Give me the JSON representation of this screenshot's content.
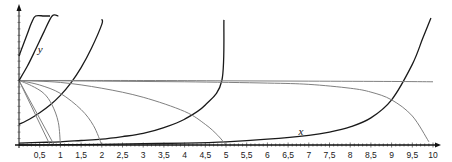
{
  "chart_data": {
    "type": "line",
    "title": "",
    "xlabel": "x",
    "ylabel": "y",
    "xlim": [
      0,
      10
    ],
    "ylim": [
      0,
      2
    ],
    "grid": false,
    "x_ticks": [
      "0,5",
      "1",
      "1,5",
      "2",
      "2,5",
      "3",
      "3,5",
      "4",
      "4,5",
      "5",
      "5,5",
      "6",
      "6,5",
      "7",
      "7,5",
      "8",
      "8,5",
      "9",
      "9,5",
      "10"
    ],
    "x_tick_values": [
      0.5,
      1,
      1.5,
      2,
      2.5,
      3,
      3.5,
      4,
      4.5,
      5,
      5.5,
      6,
      6.5,
      7,
      7.5,
      8,
      8.5,
      9,
      9.5,
      10
    ],
    "annotations": [
      {
        "text": "y",
        "x": 0.45,
        "y": 1.43
      },
      {
        "text": "x",
        "x": 6.75,
        "y": 0.16
      }
    ],
    "series": [
      {
        "name": "dark-1",
        "color": "#1a1a1a",
        "points": [
          [
            0,
            1.38
          ],
          [
            0.1,
            1.55
          ],
          [
            0.2,
            1.72
          ],
          [
            0.3,
            1.89
          ],
          [
            0.4,
            2.0
          ],
          [
            0.6,
            2.0
          ],
          [
            0.75,
            2.0
          ]
        ]
      },
      {
        "name": "dark-2",
        "color": "#1a1a1a",
        "points": [
          [
            0,
            1.0
          ],
          [
            0.2,
            1.22
          ],
          [
            0.4,
            1.48
          ],
          [
            0.6,
            1.75
          ],
          [
            0.8,
            2.0
          ],
          [
            0.95,
            2.0
          ]
        ]
      },
      {
        "name": "dark-3",
        "color": "#1a1a1a",
        "points": [
          [
            0,
            0.32
          ],
          [
            0.25,
            0.4
          ],
          [
            0.5,
            0.5
          ],
          [
            0.75,
            0.62
          ],
          [
            1.0,
            0.77
          ],
          [
            1.25,
            0.96
          ],
          [
            1.5,
            1.2
          ],
          [
            1.75,
            1.5
          ],
          [
            2.0,
            1.87
          ],
          [
            2.0,
            1.95
          ]
        ]
      },
      {
        "name": "dark-4",
        "color": "#1a1a1a",
        "points": [
          [
            0,
            0.03
          ],
          [
            0.5,
            0.04
          ],
          [
            1,
            0.05
          ],
          [
            1.5,
            0.07
          ],
          [
            2,
            0.09
          ],
          [
            2.5,
            0.13
          ],
          [
            3,
            0.18
          ],
          [
            3.5,
            0.27
          ],
          [
            4,
            0.4
          ],
          [
            4.5,
            0.62
          ],
          [
            4.9,
            1.0
          ],
          [
            4.95,
            1.94
          ]
        ]
      },
      {
        "name": "dark-5",
        "color": "#1a1a1a",
        "points": [
          [
            0,
            0.0
          ],
          [
            1,
            0.005
          ],
          [
            2,
            0.01
          ],
          [
            3,
            0.02
          ],
          [
            4,
            0.03
          ],
          [
            5,
            0.05
          ],
          [
            6,
            0.09
          ],
          [
            7,
            0.15
          ],
          [
            7.5,
            0.2
          ],
          [
            8,
            0.28
          ],
          [
            8.5,
            0.42
          ],
          [
            9,
            0.7
          ],
          [
            9.5,
            1.25
          ],
          [
            9.75,
            1.65
          ],
          [
            9.95,
            1.97
          ]
        ]
      },
      {
        "name": "gray-line-a",
        "color": "#808080",
        "points": [
          [
            0,
            1.0
          ],
          [
            0.75,
            0.0
          ]
        ]
      },
      {
        "name": "gray-line-b",
        "color": "#808080",
        "points": [
          [
            0,
            1.0
          ],
          [
            0.85,
            0.0
          ]
        ]
      },
      {
        "name": "gray-curve-1",
        "color": "#808080",
        "points": [
          [
            0,
            1.0
          ],
          [
            0.3,
            0.92
          ],
          [
            0.6,
            0.8
          ],
          [
            0.8,
            0.62
          ],
          [
            0.95,
            0.35
          ],
          [
            1.0,
            0.0
          ]
        ]
      },
      {
        "name": "gray-curve-2",
        "color": "#808080",
        "points": [
          [
            0,
            1.0
          ],
          [
            0.5,
            0.93
          ],
          [
            1.0,
            0.8
          ],
          [
            1.5,
            0.55
          ],
          [
            1.8,
            0.3
          ],
          [
            2.0,
            0.0
          ]
        ]
      },
      {
        "name": "gray-curve-5",
        "color": "#808080",
        "points": [
          [
            0,
            1.0
          ],
          [
            1,
            0.97
          ],
          [
            2,
            0.88
          ],
          [
            3,
            0.74
          ],
          [
            4,
            0.52
          ],
          [
            4.5,
            0.32
          ],
          [
            4.8,
            0.15
          ],
          [
            5.0,
            0.0
          ]
        ]
      },
      {
        "name": "gray-curve-10",
        "color": "#808080",
        "points": [
          [
            0,
            1.0
          ],
          [
            2,
            0.99
          ],
          [
            4,
            0.98
          ],
          [
            6,
            0.96
          ],
          [
            7,
            0.94
          ],
          [
            8,
            0.88
          ],
          [
            8.5,
            0.82
          ],
          [
            9,
            0.7
          ],
          [
            9.5,
            0.45
          ],
          [
            9.9,
            0.05
          ]
        ]
      },
      {
        "name": "gray-horizontal",
        "color": "#808080",
        "points": [
          [
            0,
            1.0
          ],
          [
            3,
            1.0
          ],
          [
            5,
            0.995
          ],
          [
            7,
            0.99
          ],
          [
            9,
            0.985
          ],
          [
            10,
            0.98
          ]
        ]
      }
    ]
  }
}
